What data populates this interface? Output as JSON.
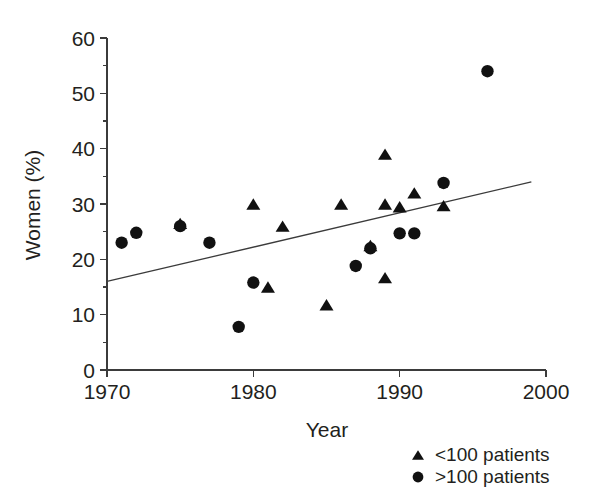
{
  "chart_data": {
    "type": "scatter",
    "title": "",
    "xlabel": "Year",
    "ylabel": "Women (%)",
    "xlim": [
      1970,
      2000
    ],
    "ylim": [
      0,
      60
    ],
    "x_ticks": [
      1970,
      1980,
      1990,
      2000
    ],
    "x_tick_labels": [
      "1970",
      "1980",
      "1990",
      "2000"
    ],
    "y_ticks": [
      0,
      10,
      20,
      30,
      40,
      50,
      60
    ],
    "y_tick_labels": [
      "0",
      "10",
      "20",
      "30",
      "40",
      "50",
      "60"
    ],
    "y_minor_ticks": [
      5,
      15,
      25,
      35,
      45,
      55
    ],
    "grid": false,
    "legend_position": "bottom-right",
    "series": [
      {
        "name": "<100 patients",
        "marker": "triangle",
        "color": "#111111",
        "points": [
          {
            "x": 1975,
            "y": 26.5
          },
          {
            "x": 1980,
            "y": 30.0
          },
          {
            "x": 1981,
            "y": 15.0
          },
          {
            "x": 1982,
            "y": 26.0
          },
          {
            "x": 1985,
            "y": 11.8
          },
          {
            "x": 1986,
            "y": 30.0
          },
          {
            "x": 1988,
            "y": 22.5
          },
          {
            "x": 1989,
            "y": 39.0
          },
          {
            "x": 1989,
            "y": 30.0
          },
          {
            "x": 1989,
            "y": 16.7
          },
          {
            "x": 1990,
            "y": 29.5
          },
          {
            "x": 1991,
            "y": 32.0
          },
          {
            "x": 1993,
            "y": 29.7
          }
        ]
      },
      {
        "name": ">100 patients",
        "marker": "circle",
        "color": "#111111",
        "points": [
          {
            "x": 1971,
            "y": 23.0
          },
          {
            "x": 1972,
            "y": 24.8
          },
          {
            "x": 1975,
            "y": 26.0
          },
          {
            "x": 1977,
            "y": 23.0
          },
          {
            "x": 1979,
            "y": 7.8
          },
          {
            "x": 1980,
            "y": 15.8
          },
          {
            "x": 1987,
            "y": 18.8
          },
          {
            "x": 1988,
            "y": 22.0
          },
          {
            "x": 1990,
            "y": 24.7
          },
          {
            "x": 1991,
            "y": 24.7
          },
          {
            "x": 1993,
            "y": 33.8
          },
          {
            "x": 1996,
            "y": 54.0
          }
        ]
      }
    ],
    "trend_line": {
      "x_start": 1970,
      "y_start": 16.0,
      "x_end": 1999,
      "y_end": 34.0
    }
  },
  "legend": {
    "items": [
      {
        "marker": "triangle",
        "label": "<100 patients"
      },
      {
        "marker": "circle",
        "label": ">100 patients"
      }
    ]
  },
  "axes": {
    "x_title": "Year",
    "y_title": "Women (%)"
  }
}
